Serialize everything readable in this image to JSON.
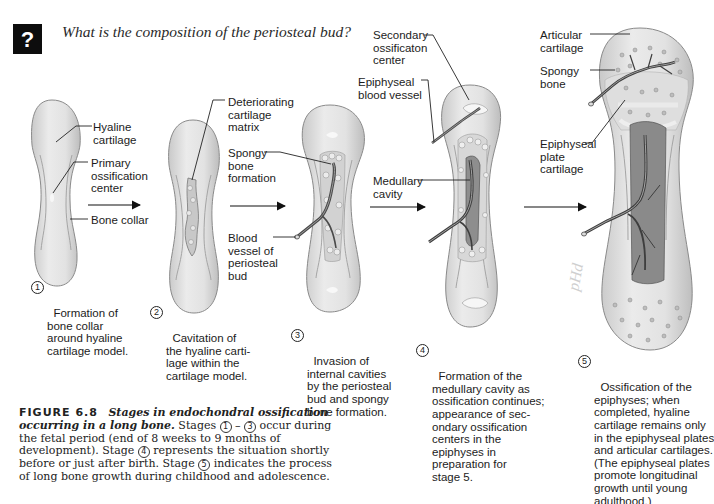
{
  "question": {
    "icon": "question-mark-icon",
    "icon_glyph": "?",
    "text": "What is the composition of the periosteal bud?"
  },
  "stages": [
    {
      "number": "1",
      "labels": [
        "Hyaline\ncartilage",
        "Primary\nossification\ncenter",
        "Bone collar"
      ],
      "caption": "Formation of\nbone collar\naround hyaline\ncartilage model."
    },
    {
      "number": "2",
      "labels": [
        "Deteriorating\ncartilage\nmatrix"
      ],
      "caption": "Cavitation of\nthe hyaline carti-\nlage within the\ncartilage model."
    },
    {
      "number": "3",
      "labels": [
        "Spongy\nbone\nformation",
        "Blood\nvessel of\nperiosteal\nbud"
      ],
      "caption": "Invasion of\ninternal cavities\nby the periosteal\nbud and spongy\nbone formation."
    },
    {
      "number": "4",
      "labels": [
        "Secondary\nossificaton\ncenter",
        "Epiphyseal\nblood vessel",
        "Medullary\ncavity"
      ],
      "caption": "Formation of the\nmedullary cavity as\nossification continues;\nappearance of sec-\nondary ossification\ncenters in the\nepiphyses in\npreparation for\nstage 5."
    },
    {
      "number": "5",
      "labels": [
        "Articular\ncartilage",
        "Spongy\nbone",
        "Epiphyseal\nplate\ncartilage"
      ],
      "caption": "Ossification of the\nepiphyses; when\ncompleted, hyaline\ncartilage remains only\nin the epiphyseal plates\nand articular cartilages.\n(The epiphyseal plates\npromote longitudinal\ngrowth until young\nadulthood.)"
    }
  ],
  "figure": {
    "number": "FIGURE 6.8",
    "title": "Stages in endochondral ossification occurring in a long bone.",
    "text_1": " Stages ",
    "circ_1": "1",
    "dash": " – ",
    "circ_3": "3",
    "text_2": " occur during the fetal period (end of 8 weeks to 9 months of development). Stage ",
    "circ_4": "4",
    "text_3": " represents the situation shortly before or just after birth. Stage ",
    "circ_5": "5",
    "text_4": " indicates the process of long bone growth during childhood and adolescence."
  },
  "watermark": "pHd",
  "colors": {
    "bone_fill": "#e4e4e4",
    "bone_edge": "#8a8a8a",
    "vessel": "#4a4a4a",
    "text": "#1c1c1c"
  }
}
